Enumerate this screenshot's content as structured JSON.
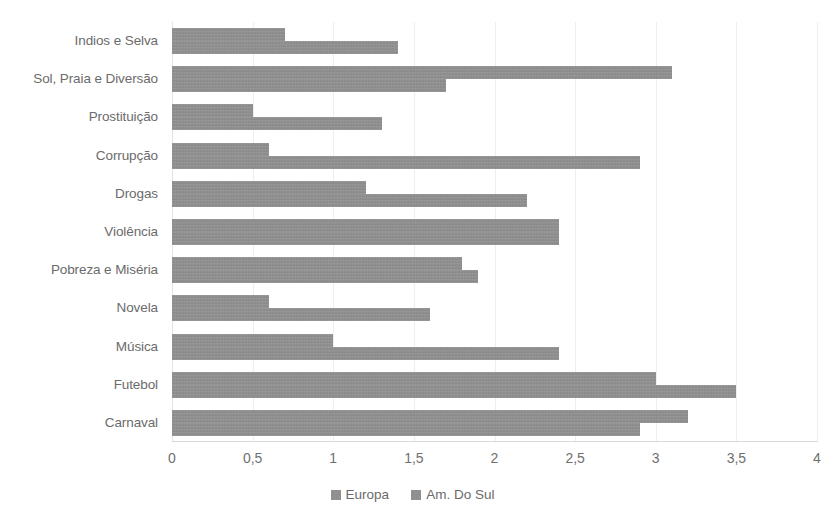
{
  "chart_data": {
    "type": "bar",
    "orientation": "horizontal",
    "title": "",
    "subtitle": "",
    "xlabel": "",
    "ylabel": "",
    "xlim": [
      0,
      4
    ],
    "xticks": [
      "0",
      "0,5",
      "1",
      "1,5",
      "2",
      "2,5",
      "3",
      "3,5",
      "4"
    ],
    "xtick_values": [
      0,
      0.5,
      1,
      1.5,
      2,
      2.5,
      3,
      3.5,
      4
    ],
    "grid": true,
    "grid_axis": "x",
    "legend_position": "bottom",
    "bar_color": "#8e8e8e",
    "categories": [
      "Indios e Selva",
      "Sol, Praia e Diversão",
      "Prostituição",
      "Corrupção",
      "Drogas",
      "Violência",
      "Pobreza e Miséria",
      "Novela",
      "Música",
      "Futebol",
      "Carnaval"
    ],
    "series": [
      {
        "name": "Europa",
        "color": "#8e8e8e",
        "values": [
          0.7,
          3.1,
          0.5,
          0.6,
          1.2,
          2.4,
          1.8,
          0.6,
          1.0,
          3.0,
          3.2
        ]
      },
      {
        "name": "Am. Do Sul",
        "color": "#8e8e8e",
        "values": [
          1.4,
          1.7,
          1.3,
          2.9,
          2.2,
          2.4,
          1.9,
          1.6,
          2.4,
          3.5,
          2.9
        ]
      }
    ]
  }
}
